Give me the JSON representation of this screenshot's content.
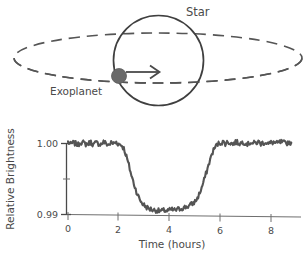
{
  "diagram": {
    "name": "exoplanet-transit-diagram",
    "star_label": "Star",
    "planet_label": "Exoplanet",
    "arrow_name": "motion-direction-arrow",
    "colors": {
      "stroke": "#4a4a4a",
      "planet_fill": "#6a6a6a",
      "orbit": "#555555"
    }
  },
  "chart_data": {
    "type": "line",
    "title": "",
    "xlabel": "Time (hours)",
    "ylabel": "Relative Brightness",
    "xlim": [
      -0.1,
      9.2
    ],
    "ylim": [
      0.9888,
      1.0012
    ],
    "xticks": [
      0,
      2,
      4,
      6,
      8
    ],
    "xtick_labels": [
      "0",
      "2",
      "4",
      "6",
      "8"
    ],
    "yticks": [
      0.99,
      0.995,
      1.0
    ],
    "ytick_labels": [
      "0.99",
      "",
      "1.00"
    ],
    "grid": false,
    "legend": null,
    "series": [
      {
        "name": "Relative Brightness",
        "color": "#555555",
        "baseline": 1.0,
        "transit_depth": 0.0095,
        "minimum": 0.9905,
        "ingress_start": 2.1,
        "ingress_end": 3.2,
        "egress_start": 5.0,
        "egress_end": 6.0,
        "noise_amplitude": 0.00035,
        "x": [
          0.0,
          0.1,
          0.2,
          0.3,
          0.4,
          0.5,
          0.6,
          0.7,
          0.8,
          0.9,
          1.0,
          1.1,
          1.2,
          1.3,
          1.4,
          1.5,
          1.6,
          1.7,
          1.8,
          1.9,
          2.0,
          2.1,
          2.2,
          2.3,
          2.4,
          2.5,
          2.6,
          2.7,
          2.8,
          2.9,
          3.0,
          3.1,
          3.2,
          3.3,
          3.4,
          3.5,
          3.6,
          3.7,
          3.8,
          3.9,
          4.0,
          4.1,
          4.2,
          4.3,
          4.4,
          4.5,
          4.6,
          4.7,
          4.8,
          4.9,
          5.0,
          5.1,
          5.2,
          5.3,
          5.4,
          5.5,
          5.6,
          5.7,
          5.8,
          5.9,
          6.0,
          6.1,
          6.2,
          6.3,
          6.4,
          6.5,
          6.6,
          6.7,
          6.8,
          6.9,
          7.0,
          7.1,
          7.2,
          7.3,
          7.4,
          7.5,
          7.6,
          7.7,
          7.8,
          7.9,
          8.0,
          8.1,
          8.2,
          8.3,
          8.4,
          8.5,
          8.6,
          8.7,
          8.8
        ],
        "values": [
          1.0002,
          0.9999,
          1.0001,
          1.0,
          0.9998,
          1.0002,
          1.0001,
          0.9999,
          1.0,
          1.0002,
          0.9998,
          1.0001,
          1.0,
          0.9999,
          1.0002,
          1.0,
          0.9998,
          1.0001,
          1.0,
          1.0002,
          0.9999,
          0.9998,
          0.9993,
          0.9982,
          0.9969,
          0.9955,
          0.9943,
          0.9932,
          0.9923,
          0.9917,
          0.9913,
          0.991,
          0.9908,
          0.9907,
          0.9906,
          0.9906,
          0.9905,
          0.9905,
          0.9906,
          0.9905,
          0.9906,
          0.9907,
          0.9906,
          0.9907,
          0.9908,
          0.9909,
          0.991,
          0.9911,
          0.9913,
          0.9915,
          0.9918,
          0.9923,
          0.9931,
          0.9941,
          0.9953,
          0.9965,
          0.9977,
          0.9988,
          0.9995,
          0.9999,
          1.0001,
          1.0002,
          1.0,
          1.0002,
          1.0001,
          0.9999,
          1.0002,
          1.0001,
          1.0,
          1.0002,
          1.0001,
          0.9999,
          1.0002,
          1.0,
          1.0001,
          1.0002,
          1.0,
          1.0001,
          1.0002,
          0.9999,
          1.0001,
          1.0002,
          1.0,
          1.0001,
          1.0002,
          1.0001,
          1.0,
          1.0002,
          1.0001
        ]
      }
    ]
  }
}
